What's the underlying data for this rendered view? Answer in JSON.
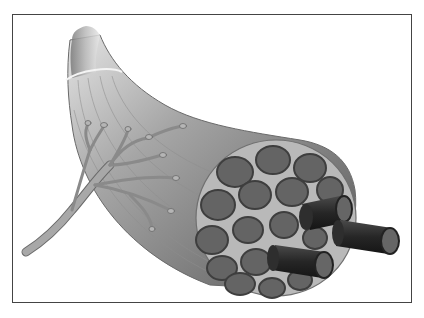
{
  "figure": {
    "style": "grayscale medical illustration",
    "labels": []
  },
  "colors": {
    "background": "#ffffff",
    "frame_border": "#444444",
    "bundle_light": "#d8d8d8",
    "bundle_mid": "#9a9a9a",
    "bundle_dark": "#5e5e5e",
    "perimysium": "#b9b9b9",
    "fiber_fill": "#646464",
    "fiber_edge": "#3e3e3e",
    "protruding_fiber": "#2e2e2e",
    "nerve": "#a8a8a8",
    "nerve_edge": "#6a6a6a"
  }
}
